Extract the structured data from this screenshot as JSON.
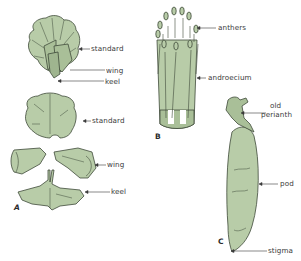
{
  "colors": {
    "fill": "#b8cca8",
    "fill_dark": "#9fb58f",
    "outline": "#3f4a3a",
    "label": "#3a3a3a"
  },
  "panels": {
    "A": {
      "letter": "A",
      "labels": {
        "standard_top": "standard",
        "wing_top": "wing",
        "keel_top": "keel",
        "standard_bottom": "standard",
        "wing_bottom": "wing",
        "keel_bottom": "keel"
      }
    },
    "B": {
      "letter": "B",
      "labels": {
        "anthers": "anthers",
        "androecium": "androecium"
      }
    },
    "C": {
      "letter": "C",
      "labels": {
        "old_perianth_line1": "old",
        "old_perianth_line2": "perianth",
        "pod": "pod",
        "stigma": "stigma"
      }
    }
  }
}
